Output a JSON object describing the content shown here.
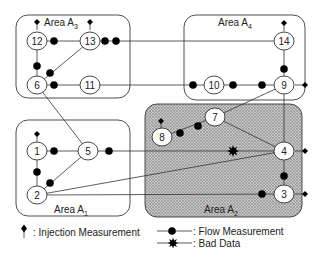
{
  "diagram": {
    "areas": [
      {
        "id": "A3",
        "label": "Area A",
        "sub": "3",
        "x": 16,
        "y": 15,
        "w": 114,
        "h": 83,
        "hatched": false,
        "label_x": 44,
        "label_y": 26
      },
      {
        "id": "A4",
        "label": "Area A",
        "sub": "4",
        "x": 184,
        "y": 15,
        "w": 121,
        "h": 85,
        "hatched": false,
        "label_x": 218,
        "label_y": 26
      },
      {
        "id": "A1",
        "label": "Area A",
        "sub": "1",
        "x": 16,
        "y": 120,
        "w": 114,
        "h": 96,
        "hatched": false,
        "label_x": 54,
        "label_y": 213
      },
      {
        "id": "A2",
        "label": "Area A",
        "sub": "2",
        "x": 145,
        "y": 104,
        "w": 157,
        "h": 113,
        "hatched": true,
        "label_x": 204,
        "label_y": 213
      }
    ],
    "nodes": [
      {
        "id": "1",
        "x": 37,
        "y": 151
      },
      {
        "id": "2",
        "x": 37,
        "y": 195
      },
      {
        "id": "3",
        "x": 284,
        "y": 194
      },
      {
        "id": "4",
        "x": 284,
        "y": 151
      },
      {
        "id": "5",
        "x": 88,
        "y": 151
      },
      {
        "id": "6",
        "x": 37,
        "y": 85
      },
      {
        "id": "7",
        "x": 215,
        "y": 117
      },
      {
        "id": "8",
        "x": 162,
        "y": 137
      },
      {
        "id": "9",
        "x": 284,
        "y": 85
      },
      {
        "id": "10",
        "x": 214,
        "y": 85
      },
      {
        "id": "11",
        "x": 90,
        "y": 85
      },
      {
        "id": "12",
        "x": 37,
        "y": 41
      },
      {
        "id": "13",
        "x": 90,
        "y": 41
      },
      {
        "id": "14",
        "x": 284,
        "y": 41
      }
    ],
    "branches": [
      [
        "12",
        "13"
      ],
      [
        "12",
        "6"
      ],
      [
        "13",
        "6"
      ],
      [
        "6",
        "11"
      ],
      [
        "13",
        "14"
      ],
      [
        "11",
        "10"
      ],
      [
        "10",
        "9"
      ],
      [
        "14",
        "9"
      ],
      [
        "6",
        "5"
      ],
      [
        "1",
        "5"
      ],
      [
        "1",
        "2"
      ],
      [
        "2",
        "5"
      ],
      [
        "5",
        "4"
      ],
      [
        "2",
        "4"
      ],
      [
        "2",
        "3"
      ],
      [
        "8",
        "7"
      ],
      [
        "7",
        "4"
      ],
      [
        "9",
        "4"
      ],
      [
        "9",
        "7"
      ],
      [
        "4",
        "3"
      ]
    ],
    "flow_measurements": [
      {
        "x": 54,
        "y": 41
      },
      {
        "x": 105,
        "y": 41
      },
      {
        "x": 37,
        "y": 66
      },
      {
        "x": 50,
        "y": 73
      },
      {
        "x": 54,
        "y": 85
      },
      {
        "x": 116,
        "y": 41
      },
      {
        "x": 193,
        "y": 85
      },
      {
        "x": 233,
        "y": 85
      },
      {
        "x": 262,
        "y": 85
      },
      {
        "x": 284,
        "y": 69
      },
      {
        "x": 54,
        "y": 151
      },
      {
        "x": 37,
        "y": 172
      },
      {
        "x": 50,
        "y": 183
      },
      {
        "x": 109,
        "y": 151
      },
      {
        "x": 180,
        "y": 133
      },
      {
        "x": 198,
        "y": 126
      },
      {
        "x": 284,
        "y": 176
      },
      {
        "x": 262,
        "y": 194
      }
    ],
    "bad_data": [
      {
        "x": 233,
        "y": 151
      }
    ],
    "injection_measurements": [
      {
        "x": 37,
        "y": 22,
        "dir": "up"
      },
      {
        "x": 90,
        "y": 22,
        "dir": "up"
      },
      {
        "x": 284,
        "y": 23,
        "dir": "up"
      },
      {
        "x": 305,
        "y": 85,
        "dir": "right"
      },
      {
        "x": 37,
        "y": 134,
        "dir": "up"
      },
      {
        "x": 161,
        "y": 121,
        "dir": "up"
      },
      {
        "x": 305,
        "y": 151,
        "dir": "right"
      },
      {
        "x": 305,
        "y": 194,
        "dir": "right"
      }
    ]
  },
  "legend": {
    "injection_label": ": Injection Measurement",
    "flow_label": ": Flow Measurement",
    "bad_data_label": ": Bad Data"
  }
}
